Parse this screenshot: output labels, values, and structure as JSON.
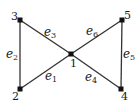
{
  "graph": {
    "colors": {
      "edge": "#333333",
      "node": "#111111",
      "text": "#1a1a1a",
      "background": "#ffffff"
    },
    "nodes": [
      {
        "id": "1",
        "label": "1",
        "x": 71,
        "y": 54,
        "lx": 70,
        "ly": 67
      },
      {
        "id": "2",
        "label": "2",
        "x": 20,
        "y": 89,
        "lx": 12,
        "ly": 100
      },
      {
        "id": "3",
        "label": "3",
        "x": 20,
        "y": 20,
        "lx": 11,
        "ly": 20
      },
      {
        "id": "4",
        "label": "4",
        "x": 121,
        "y": 89,
        "lx": 121,
        "ly": 100
      },
      {
        "id": "5",
        "label": "5",
        "x": 122,
        "y": 20,
        "lx": 124,
        "ly": 19
      }
    ],
    "edges": [
      {
        "id": "e1",
        "base": "e",
        "sub": "1",
        "from": "2",
        "to": "1",
        "lx": 45,
        "ly": 80
      },
      {
        "id": "e2",
        "base": "e",
        "sub": "2",
        "from": "3",
        "to": "2",
        "lx": 6,
        "ly": 58
      },
      {
        "id": "e3",
        "base": "e",
        "sub": "3",
        "from": "3",
        "to": "1",
        "lx": 44,
        "ly": 36
      },
      {
        "id": "e4",
        "base": "e",
        "sub": "4",
        "from": "1",
        "to": "4",
        "lx": 85,
        "ly": 81
      },
      {
        "id": "e5",
        "base": "e",
        "sub": "5",
        "from": "5",
        "to": "4",
        "lx": 123,
        "ly": 58
      },
      {
        "id": "e6",
        "base": "e",
        "sub": "6",
        "from": "1",
        "to": "5",
        "lx": 86,
        "ly": 35
      }
    ]
  }
}
